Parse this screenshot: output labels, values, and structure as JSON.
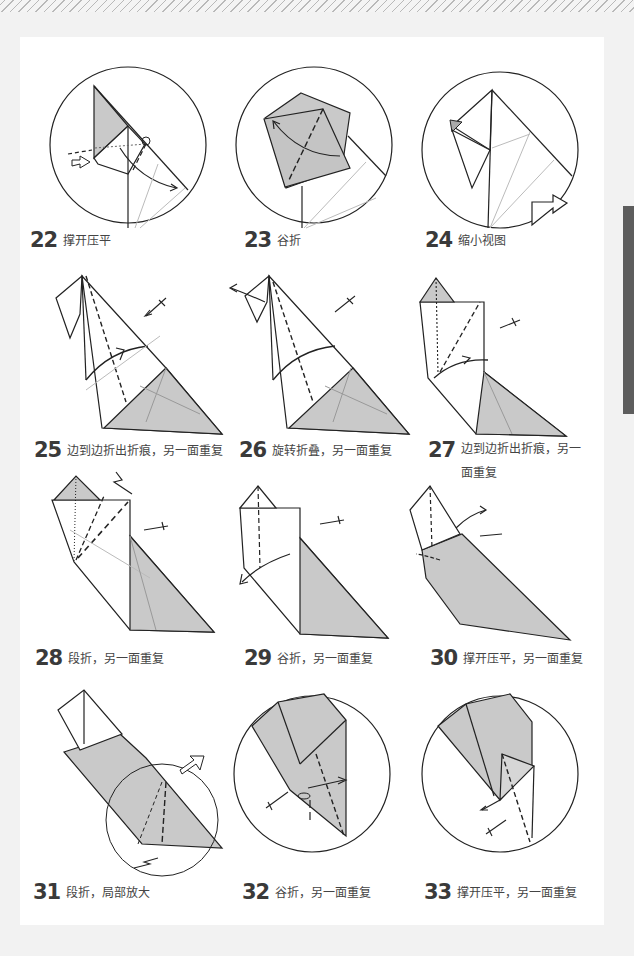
{
  "page": {
    "background": "#f2f2f2",
    "paper_color": "#ffffff",
    "side_tab_color": "#5d5d5d",
    "paper_fill": "#c9c9c9",
    "line_color": "#222222",
    "crease_color": "#bdbdbd"
  },
  "steps": [
    {
      "number": "22",
      "caption": "撑开压平",
      "view": "circle-detail"
    },
    {
      "number": "23",
      "caption": "谷折",
      "view": "circle-detail"
    },
    {
      "number": "24",
      "caption": "缩小视图",
      "view": "circle-detail"
    },
    {
      "number": "25",
      "caption": "边到边折出折痕，另一面重复",
      "view": "full"
    },
    {
      "number": "26",
      "caption": "旋转折叠，另一面重复",
      "view": "full"
    },
    {
      "number": "27",
      "caption": "边到边折出折痕，另一面重复",
      "view": "full"
    },
    {
      "number": "28",
      "caption": "段折，另一面重复",
      "view": "full"
    },
    {
      "number": "29",
      "caption": "谷折，另一面重复",
      "view": "full"
    },
    {
      "number": "30",
      "caption": "撑开压平，另一面重复",
      "view": "full"
    },
    {
      "number": "31",
      "caption": "段折，局部放大",
      "view": "full"
    },
    {
      "number": "32",
      "caption": "谷折，另一面重复",
      "view": "circle-detail"
    },
    {
      "number": "33",
      "caption": "撑开压平，另一面重复",
      "view": "circle-detail"
    }
  ]
}
